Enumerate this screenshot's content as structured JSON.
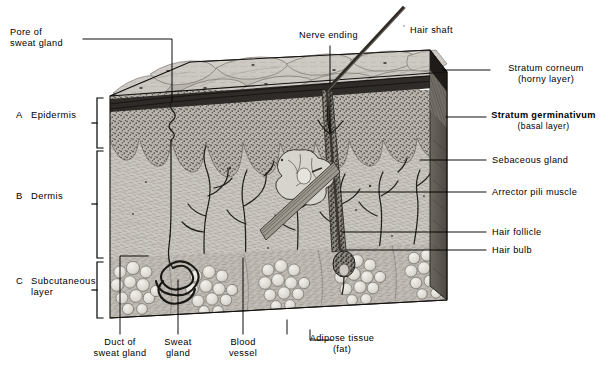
{
  "figure": {
    "type": "anatomical-diagram",
    "view": "three-dimensional block section"
  },
  "layers": [
    {
      "key": "A",
      "index": "A",
      "name": "Epidermis",
      "name_line2": ""
    },
    {
      "key": "B",
      "index": "B",
      "name": "Dermis",
      "name_line2": ""
    },
    {
      "key": "C",
      "index": "C",
      "name": "Subcutaneous",
      "name_line2": "layer"
    }
  ],
  "labels_top": [
    {
      "id": "pore",
      "line1": "Pore of",
      "line2": "sweat gland"
    },
    {
      "id": "nerve",
      "line1": "Nerve ending",
      "line2": ""
    },
    {
      "id": "hair_shaft",
      "line1": "Hair shaft",
      "line2": ""
    }
  ],
  "labels_right": [
    {
      "id": "stratum_corneum",
      "line1": "Stratum corneum",
      "line2": "(horny layer)",
      "bold": false
    },
    {
      "id": "stratum_germinativum",
      "line1": "Stratum germinativum",
      "line2": "(basal layer)",
      "bold": true
    },
    {
      "id": "sebaceous_gland",
      "line1": "Sebaceous gland",
      "line2": "",
      "bold": false
    },
    {
      "id": "arrector_pili",
      "line1": "Arrector pili muscle",
      "line2": "",
      "bold": false
    },
    {
      "id": "hair_follicle",
      "line1": "Hair follicle",
      "line2": "",
      "bold": false
    },
    {
      "id": "hair_bulb",
      "line1": "Hair bulb",
      "line2": "",
      "bold": false
    }
  ],
  "labels_bottom": [
    {
      "id": "duct",
      "line1": "Duct of",
      "line2": "sweat gland"
    },
    {
      "id": "sweat_gland",
      "line1": "Sweat",
      "line2": "gland"
    },
    {
      "id": "blood_vessel",
      "line1": "Blood",
      "line2": "vessel"
    },
    {
      "id": "adipose",
      "line1": "Adipose tissue",
      "line2": "(fat)"
    }
  ],
  "colors": {
    "ink": "#000000",
    "paper": "#ffffff",
    "surface_light": "#d7d4cf",
    "surface_mid": "#b5b1ab",
    "surface_dark": "#8d8882",
    "corneum_band": "#3a3734",
    "epidermis_stipple": "#9b968f",
    "dermis": "#c9c5bf",
    "dermis_shadow": "#a7a29b",
    "fat_cell": "#e2dfd9",
    "fat_matrix": "#b0aba4",
    "right_face": "#6e6962",
    "hair": "#4a443d"
  }
}
